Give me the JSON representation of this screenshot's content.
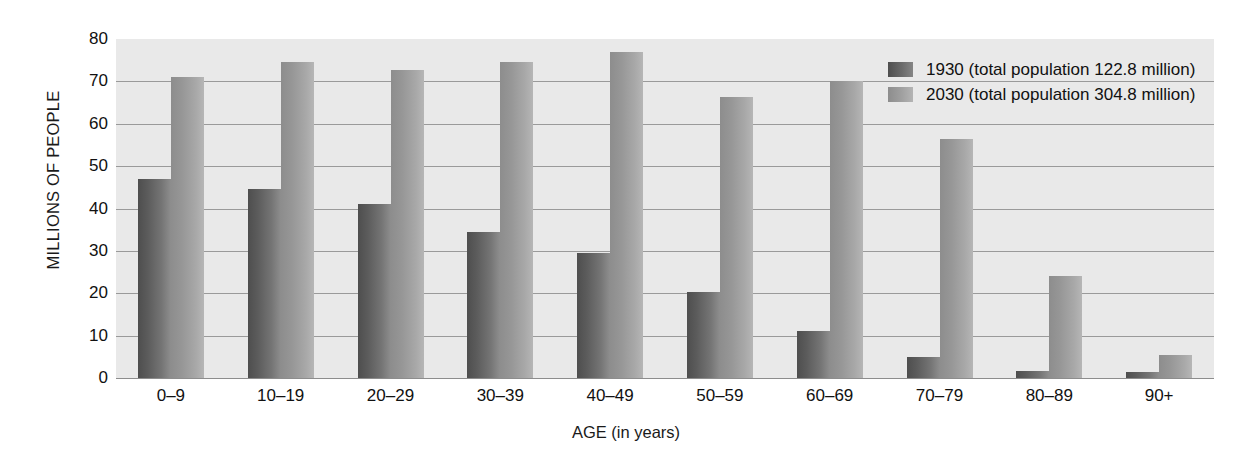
{
  "chart_data": {
    "type": "bar",
    "title": "",
    "xlabel": "AGE (in years)",
    "ylabel": "MILLIONS OF PEOPLE",
    "ylim": [
      0,
      80
    ],
    "yticks": [
      0,
      10,
      20,
      30,
      40,
      50,
      60,
      70,
      80
    ],
    "ytick_labels": [
      "0",
      "10",
      "20",
      "30",
      "40",
      "50",
      "60",
      "70",
      "80"
    ],
    "grid": true,
    "legend_position": "top-right",
    "categories": [
      "0–9",
      "10–19",
      "20–29",
      "30–39",
      "40–49",
      "50–59",
      "60–69",
      "70–79",
      "80–89",
      "90+"
    ],
    "series": [
      {
        "name": "1930 (total population 122.8 million)",
        "short_name": "1930",
        "color": "#5c5c5c",
        "values": [
          47.0,
          44.5,
          41.0,
          34.5,
          29.5,
          20.2,
          11.0,
          5.0,
          1.6,
          1.4
        ]
      },
      {
        "name": "2030 (total population 304.8 million)",
        "short_name": "2030",
        "color": "#a3a3a3",
        "values": [
          71.0,
          74.5,
          72.7,
          74.5,
          77.0,
          66.3,
          70.2,
          56.3,
          24.0,
          5.5
        ]
      }
    ]
  },
  "legend": {
    "items": [
      {
        "label": "1930 (total population 122.8 million)",
        "series": 0
      },
      {
        "label": "2030 (total population 304.8 million)",
        "series": 1
      }
    ]
  },
  "style": {
    "plot_background": "#e9e9e9",
    "page_background": "#ffffff",
    "gridline_color": "#9a9a9a",
    "text_color": "#111111"
  }
}
